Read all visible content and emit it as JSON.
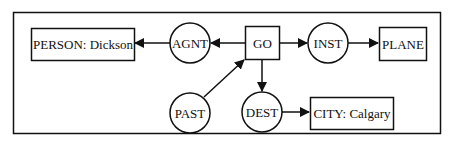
{
  "diagram": {
    "type": "conceptual-graph",
    "colors": {
      "stroke": "#111111",
      "background": "#ffffff"
    },
    "concepts": [
      {
        "id": "person",
        "label": "PERSON: Dickson"
      },
      {
        "id": "go",
        "label": "GO"
      },
      {
        "id": "plane",
        "label": "PLANE"
      },
      {
        "id": "city",
        "label": "CITY: Calgary"
      }
    ],
    "relations": [
      {
        "id": "agnt",
        "label": "AGNT"
      },
      {
        "id": "inst",
        "label": "INST"
      },
      {
        "id": "past",
        "label": "PAST"
      },
      {
        "id": "dest",
        "label": "DEST"
      }
    ],
    "edges": [
      {
        "from": "go",
        "to": "agnt"
      },
      {
        "from": "agnt",
        "to": "person"
      },
      {
        "from": "go",
        "to": "inst"
      },
      {
        "from": "inst",
        "to": "plane"
      },
      {
        "from": "past",
        "to": "go"
      },
      {
        "from": "go",
        "to": "dest"
      },
      {
        "from": "dest",
        "to": "city"
      }
    ]
  }
}
